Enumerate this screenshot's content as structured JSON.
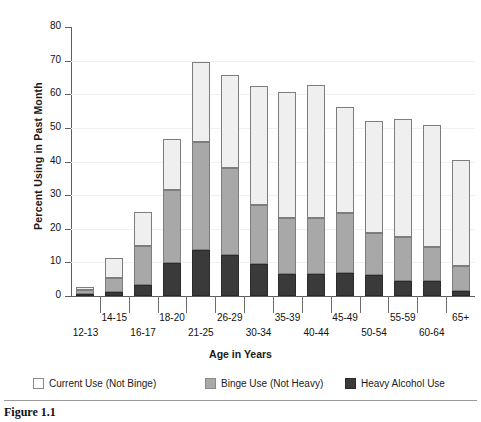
{
  "caption": "Figure 1.1",
  "legend": [
    {
      "key": "current",
      "label": "Current Use (Not Binge)",
      "color": "#ffffff"
    },
    {
      "key": "binge",
      "label": "Binge Use (Not Heavy)",
      "color": "#a8a8a8"
    },
    {
      "key": "heavy",
      "label": "Heavy Alcohol Use",
      "color": "#3a3a3a"
    }
  ],
  "chart_data": {
    "type": "bar",
    "stacked": true,
    "title": "",
    "xlabel": "Age in Years",
    "ylabel": "Percent Using in Past Month",
    "ylim": [
      0,
      80
    ],
    "yticks": [
      0,
      10,
      20,
      30,
      40,
      50,
      60,
      70,
      80
    ],
    "grid": false,
    "legend_position": "bottom",
    "categories": [
      "12-13",
      "14-15",
      "16-17",
      "18-20",
      "21-25",
      "26-29",
      "30-34",
      "35-39",
      "40-44",
      "45-49",
      "50-54",
      "55-59",
      "60-64",
      "65+"
    ],
    "series": [
      {
        "name": "Heavy Alcohol Use",
        "values": [
          0.5,
          1.1,
          3.3,
          9.9,
          13.8,
          12.1,
          9.4,
          6.4,
          6.4,
          6.7,
          6.2,
          4.4,
          4.6,
          1.5
        ]
      },
      {
        "name": "Binge Use (Not Heavy)",
        "values": [
          1.2,
          4.4,
          11.5,
          21.6,
          31.9,
          26.0,
          17.7,
          16.9,
          16.9,
          18.1,
          12.4,
          13.1,
          9.9,
          7.3
        ]
      },
      {
        "name": "Current Use (Not Binge)",
        "values": [
          1.0,
          5.7,
          10.3,
          15.3,
          24.0,
          27.5,
          35.4,
          37.4,
          39.4,
          31.4,
          33.4,
          35.0,
          36.5,
          31.7
        ]
      }
    ],
    "totals": [
      2.7,
      11.2,
      25.1,
      46.8,
      69.7,
      65.6,
      62.5,
      60.7,
      62.7,
      56.2,
      52.0,
      52.5,
      51.0,
      40.5
    ],
    "cumulative_heavy_top": [
      0.5,
      1.1,
      3.3,
      9.9,
      13.8,
      12.1,
      9.4,
      6.4,
      6.4,
      6.7,
      6.2,
      4.4,
      4.6,
      1.5
    ],
    "cumulative_binge_top": [
      1.7,
      5.5,
      14.8,
      31.5,
      45.7,
      38.1,
      27.1,
      23.3,
      23.3,
      24.8,
      18.6,
      17.5,
      14.5,
      8.8
    ]
  }
}
